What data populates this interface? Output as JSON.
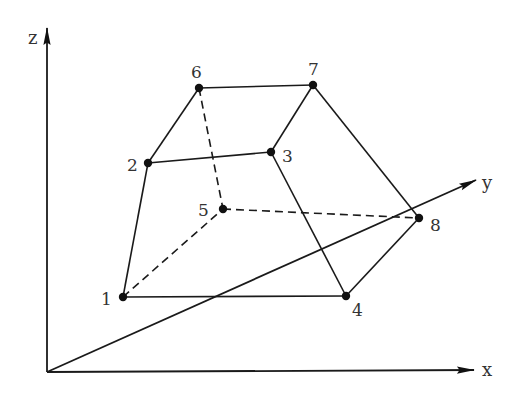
{
  "diagram": {
    "title": "",
    "axes": {
      "origin": [
        47,
        372
      ],
      "z": {
        "label": "z",
        "tip": [
          47,
          28
        ],
        "label_pos": [
          28,
          44
        ]
      },
      "x": {
        "label": "x",
        "tip": [
          474,
          370
        ],
        "label_pos": [
          482,
          376
        ]
      },
      "y": {
        "label": "y",
        "tip": [
          476,
          180
        ],
        "label_pos": [
          482,
          189
        ]
      }
    },
    "nodes": [
      {
        "id": "1",
        "label": "1",
        "pos": [
          123,
          297
        ],
        "label_pos": [
          101,
          305
        ]
      },
      {
        "id": "2",
        "label": "2",
        "pos": [
          148,
          163
        ],
        "label_pos": [
          127,
          171
        ]
      },
      {
        "id": "3",
        "label": "3",
        "pos": [
          271,
          152
        ],
        "label_pos": [
          282,
          162
        ]
      },
      {
        "id": "4",
        "label": "4",
        "pos": [
          346,
          296
        ],
        "label_pos": [
          352,
          316
        ]
      },
      {
        "id": "5",
        "label": "5",
        "pos": [
          223,
          209
        ],
        "label_pos": [
          198,
          216
        ]
      },
      {
        "id": "6",
        "label": "6",
        "pos": [
          199,
          88
        ],
        "label_pos": [
          191,
          78
        ]
      },
      {
        "id": "7",
        "label": "7",
        "pos": [
          313,
          85
        ],
        "label_pos": [
          308,
          75
        ]
      },
      {
        "id": "8",
        "label": "8",
        "pos": [
          419,
          218
        ],
        "label_pos": [
          430,
          231
        ]
      }
    ],
    "edges_solid": [
      [
        "1",
        "2"
      ],
      [
        "2",
        "6"
      ],
      [
        "6",
        "7"
      ],
      [
        "2",
        "3"
      ],
      [
        "3",
        "7"
      ],
      [
        "3",
        "4"
      ],
      [
        "1",
        "4"
      ],
      [
        "7",
        "8"
      ],
      [
        "4",
        "8"
      ]
    ],
    "edges_dashed": [
      [
        "6",
        "5"
      ],
      [
        "1",
        "5"
      ],
      [
        "5",
        "8"
      ]
    ]
  }
}
